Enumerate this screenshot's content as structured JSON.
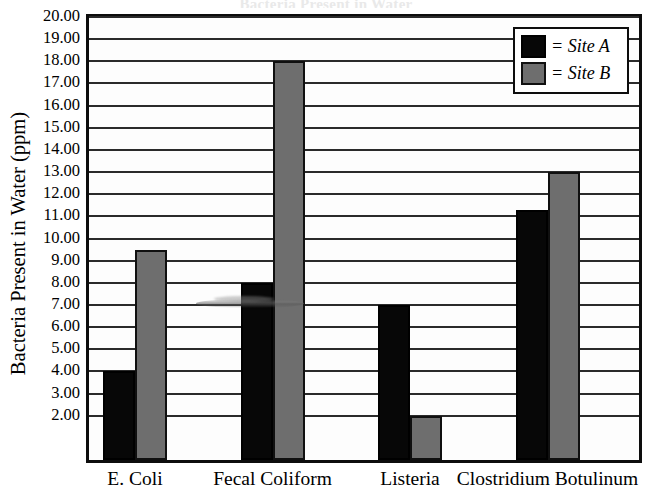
{
  "chart_data": {
    "type": "bar",
    "title": "Bacteria Present in Water",
    "xlabel": "",
    "ylabel": "Bacteria Present in Water (ppm)",
    "ylim": [
      0,
      20
    ],
    "ytick_step": 1,
    "ytick_labels": [
      "20.00",
      "19.00",
      "18.00",
      "17.00",
      "16.00",
      "15.00",
      "14.00",
      "13.00",
      "12.00",
      "11.00",
      "10.00",
      "9.00",
      "8.00",
      "7.00",
      "6.00",
      "5.00",
      "4.00",
      "3.00",
      "2.00"
    ],
    "ytick_values": [
      20,
      19,
      18,
      17,
      16,
      15,
      14,
      13,
      12,
      11,
      10,
      9,
      8,
      7,
      6,
      5,
      4,
      3,
      2
    ],
    "grid": true,
    "legend_position": "top-right",
    "categories": [
      "E. Coli",
      "Fecal Coliform",
      "Listeria",
      "Clostridium Botulinum"
    ],
    "series": [
      {
        "name": "Site A",
        "color": "#070707",
        "values": [
          4.0,
          8.0,
          7.0,
          11.3
        ]
      },
      {
        "name": "Site B",
        "color": "#6e6e6e",
        "values": [
          9.5,
          18.0,
          2.0,
          13.0
        ]
      }
    ]
  },
  "legend": {
    "rows": [
      {
        "label": "= Site A",
        "swatch": "black-square-icon"
      },
      {
        "label": "= Site B",
        "swatch": "gray-square-icon"
      }
    ]
  },
  "axis": {
    "y_title": "Bacteria Present in Water (ppm)"
  },
  "colors": {
    "site_a": "#070707",
    "site_b": "#6e6e6e",
    "frame": "#0d0d0d",
    "gridline": "#2a2a2a",
    "background": "#ffffff"
  }
}
